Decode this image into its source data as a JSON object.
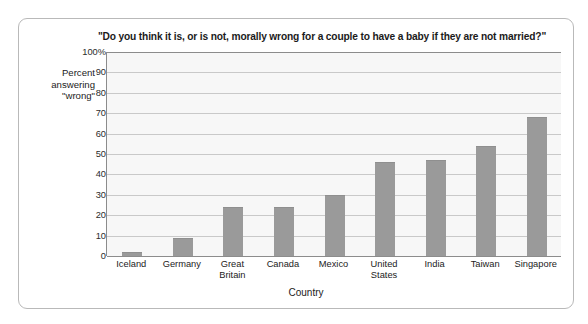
{
  "chart_data": {
    "type": "bar",
    "title": "\"Do you think it is, or is not, morally wrong for a couple to have a baby if they are not married?\"",
    "xlabel": "Country",
    "ylabel": "Percent answering \"wrong\"",
    "ylabel_lines": [
      "Percent",
      "answering",
      "\"wrong\""
    ],
    "categories": [
      "Iceland",
      "Germany",
      "Great Britain",
      "Canada",
      "Mexico",
      "United States",
      "India",
      "Taiwan",
      "Singapore"
    ],
    "category_lines": [
      [
        "Iceland"
      ],
      [
        "Germany"
      ],
      [
        "Great",
        "Britain"
      ],
      [
        "Canada"
      ],
      [
        "Mexico"
      ],
      [
        "United",
        "States"
      ],
      [
        "India"
      ],
      [
        "Taiwan"
      ],
      [
        "Singapore"
      ]
    ],
    "values": [
      2,
      9,
      24,
      24,
      30,
      46,
      47,
      54,
      68
    ],
    "ylim": [
      0,
      100
    ],
    "ytick_values": [
      0,
      10,
      20,
      30,
      40,
      50,
      60,
      70,
      80,
      90,
      100
    ],
    "ytick_labels": [
      "0",
      "10",
      "20",
      "30",
      "40",
      "50",
      "60",
      "70",
      "80",
      "90",
      "100%"
    ],
    "grid": true,
    "legend": false,
    "bar_color": "#9a9a9a",
    "plot_background": "#f7f7f7",
    "gridline_color": "#c9c9c9",
    "axis_color": "#8c8c8c"
  }
}
